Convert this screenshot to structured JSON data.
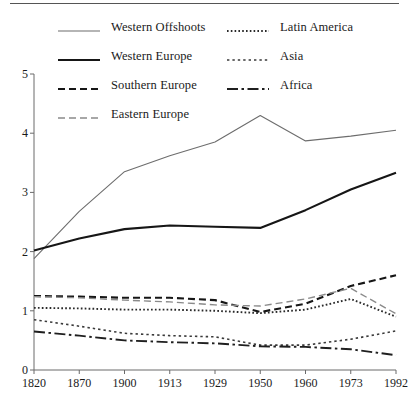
{
  "chart_data": {
    "type": "line",
    "title": "",
    "subtitle": "",
    "xlabel": "",
    "ylabel": "",
    "x": [
      "1820",
      "1870",
      "1900",
      "1913",
      "1929",
      "1950",
      "1960",
      "1973",
      "1992"
    ],
    "categories": [
      "1820",
      "1870",
      "1900",
      "1913",
      "1929",
      "1950",
      "1960",
      "1973",
      "1992"
    ],
    "xtick_labels": [
      "1820",
      "1870",
      "1900",
      "1913",
      "1929",
      "1950",
      "1960",
      "1973",
      "1992"
    ],
    "ytick_labels": [
      "0",
      "1",
      "2",
      "3",
      "4",
      "5"
    ],
    "yticks": [
      0,
      1,
      2,
      3,
      4,
      5
    ],
    "ylim": [
      0,
      5
    ],
    "grid": false,
    "legend_position": "top",
    "axis_type": "categorical-evenly-spaced",
    "series": [
      {
        "name": "Western Offshoots",
        "style": "solid-thin",
        "color": "#6d6d6d",
        "values": [
          1.88,
          2.68,
          3.35,
          3.62,
          3.85,
          4.3,
          3.87,
          3.95,
          4.05
        ]
      },
      {
        "name": "Western Europe",
        "style": "solid-thick",
        "color": "#161616",
        "values": [
          2.02,
          2.22,
          2.38,
          2.44,
          2.42,
          2.4,
          2.7,
          3.05,
          3.33
        ]
      },
      {
        "name": "Southern Europe",
        "style": "dash-thick",
        "color": "#161616",
        "values": [
          1.25,
          1.24,
          1.22,
          1.22,
          1.18,
          0.98,
          1.12,
          1.42,
          1.6
        ]
      },
      {
        "name": "Eastern Europe",
        "style": "dash-light",
        "color": "#8a8a8a",
        "values": [
          1.24,
          1.22,
          1.18,
          1.15,
          1.1,
          1.08,
          1.2,
          1.38,
          0.95
        ]
      },
      {
        "name": "Latin America",
        "style": "dot-loose",
        "color": "#2a2a2a",
        "values": [
          1.05,
          1.04,
          1.02,
          1.02,
          1.0,
          0.96,
          1.02,
          1.2,
          0.9
        ]
      },
      {
        "name": "Asia",
        "style": "dot-fine",
        "color": "#3a3a3a",
        "values": [
          0.85,
          0.74,
          0.62,
          0.58,
          0.56,
          0.42,
          0.42,
          0.52,
          0.66
        ]
      },
      {
        "name": "Africa",
        "style": "dash-dot",
        "color": "#1f1f1f",
        "values": [
          0.65,
          0.58,
          0.5,
          0.47,
          0.45,
          0.4,
          0.39,
          0.35,
          0.25
        ]
      }
    ]
  },
  "legend": {
    "items": [
      {
        "label": "Western Offshoots",
        "style": "solid-thin",
        "col": 0,
        "row": 0
      },
      {
        "label": "Western Europe",
        "style": "solid-thick",
        "col": 0,
        "row": 1
      },
      {
        "label": "Southern Europe",
        "style": "dash-thick",
        "col": 0,
        "row": 2
      },
      {
        "label": "Eastern Europe",
        "style": "dash-light",
        "col": 0,
        "row": 3
      },
      {
        "label": "Latin America",
        "style": "dot-loose",
        "col": 1,
        "row": 0
      },
      {
        "label": "Asia",
        "style": "dot-fine",
        "col": 1,
        "row": 1
      },
      {
        "label": "Africa",
        "style": "dash-dot",
        "col": 1,
        "row": 2
      }
    ]
  }
}
